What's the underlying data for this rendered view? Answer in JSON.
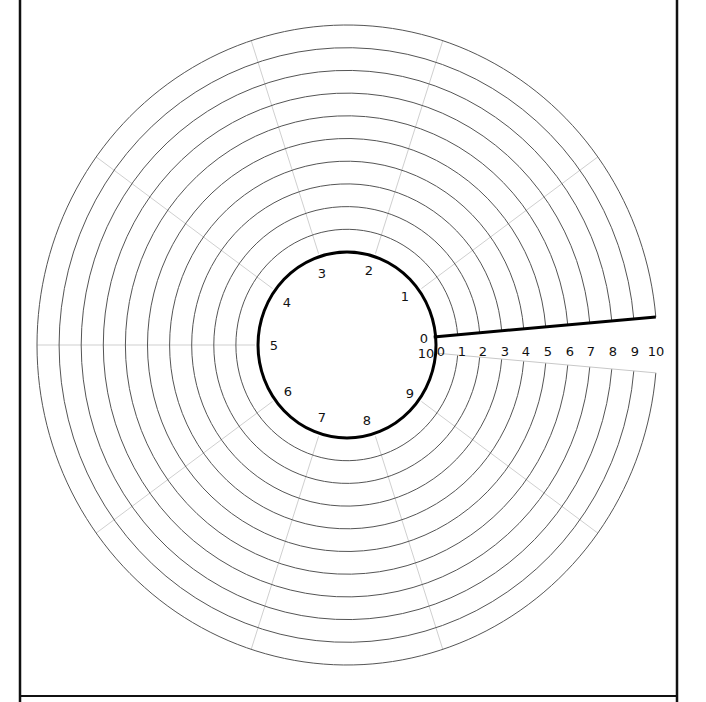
{
  "diagram": {
    "title": "",
    "type": "polar-spiral-grid",
    "colors": {
      "background": "#ffffff",
      "frame": "#111111",
      "ring": "#555555",
      "spoke": "#cfcfcf",
      "inner_circle": "#000000",
      "start_line": "#000000",
      "end_line": "#c8c8c8",
      "label": "#111111"
    },
    "geometry": {
      "center": [
        347,
        345
      ],
      "inner_radius": [
        89,
        93
      ],
      "ring_step": [
        22.1,
        22.7
      ],
      "ring_count": 10,
      "gap_start_deg": 5,
      "gap_end_deg": -5,
      "spoke_angles_deg": [
        36,
        72,
        108,
        144,
        180,
        216,
        252,
        288,
        324
      ]
    },
    "circle_labels": [
      {
        "text": "0",
        "x": 424,
        "y": 343
      },
      {
        "text": "10",
        "x": 426,
        "y": 358
      },
      {
        "text": "1",
        "x": 405,
        "y": 301
      },
      {
        "text": "2",
        "x": 369,
        "y": 275
      },
      {
        "text": "3",
        "x": 322,
        "y": 278
      },
      {
        "text": "4",
        "x": 287,
        "y": 307
      },
      {
        "text": "5",
        "x": 274,
        "y": 350
      },
      {
        "text": "6",
        "x": 288,
        "y": 396
      },
      {
        "text": "7",
        "x": 322,
        "y": 422
      },
      {
        "text": "8",
        "x": 367,
        "y": 425
      },
      {
        "text": "9",
        "x": 410,
        "y": 398
      }
    ],
    "radial_labels": [
      "0",
      "1",
      "2",
      "3",
      "4",
      "5",
      "6",
      "7",
      "8",
      "9",
      "10"
    ],
    "radial_label_x": [
      441,
      462,
      483,
      505,
      526,
      548,
      570,
      591,
      613,
      635,
      656
    ],
    "radial_label_y": 352
  }
}
